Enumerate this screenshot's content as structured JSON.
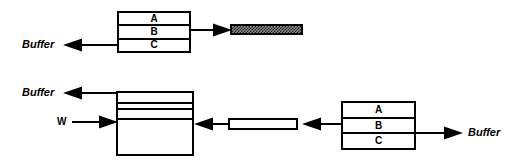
{
  "diagram": {
    "width": 523,
    "height": 166,
    "background_color": "#ffffff",
    "line_color": "#000000"
  },
  "top_row": {
    "source_stack": {
      "name": "top-source-stack",
      "cells": [
        "A",
        "B",
        "C"
      ],
      "x": 117,
      "y": 11,
      "width": 74,
      "height": 42
    },
    "out_arrow_left": {
      "label": "Buffer",
      "direction": "left",
      "x": 63,
      "y": 38,
      "length": 54
    },
    "out_arrow_right": {
      "direction": "right",
      "x": 191,
      "y": 23,
      "length": 39
    },
    "filled_bar": {
      "name": "hatched-bar",
      "fill": "checker",
      "fill_color": "#1a1a1a",
      "x": 230,
      "y": 24,
      "width": 73,
      "height": 11
    }
  },
  "bottom_row": {
    "buffer_box": {
      "name": "buffer-accumulator",
      "x": 116,
      "y": 91,
      "width": 78,
      "height": 65,
      "band_offsets": [
        11,
        17,
        27
      ]
    },
    "buffer_out_arrow": {
      "label": "Buffer",
      "direction": "left",
      "x": 63,
      "y": 86,
      "length": 53
    },
    "w_in_arrow": {
      "label": "W",
      "direction": "right",
      "x": 70,
      "y": 115,
      "length": 46
    },
    "mid_arrow_left": {
      "direction": "left",
      "x": 194,
      "y": 117,
      "length": 34
    },
    "empty_bar": {
      "name": "empty-bar",
      "fill": "none",
      "x": 228,
      "y": 118,
      "width": 70,
      "height": 12
    },
    "right_arrow_left": {
      "direction": "left",
      "x": 303,
      "y": 117,
      "length": 38
    },
    "source_stack": {
      "name": "bottom-source-stack",
      "cells": [
        "A",
        "B",
        "C"
      ],
      "x": 341,
      "y": 101,
      "width": 75,
      "height": 49
    },
    "right_out_arrow": {
      "label": "Buffer",
      "direction": "right",
      "x": 416,
      "y": 126,
      "length": 45
    }
  },
  "labels": {
    "buffer": "Buffer",
    "w": "W",
    "cell_a": "A",
    "cell_b": "B",
    "cell_c": "C"
  }
}
